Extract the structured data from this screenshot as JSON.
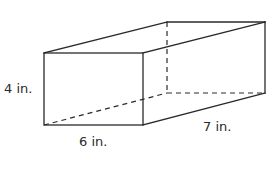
{
  "figure": {
    "type": "rectangular-prism",
    "dimensions": {
      "height": {
        "value": 4,
        "unit": "in.",
        "label": "4 in."
      },
      "width": {
        "value": 6,
        "unit": "in.",
        "label": "6 in."
      },
      "depth": {
        "value": 7,
        "unit": "in.",
        "label": "7 in."
      }
    },
    "stroke_color": "#2a2a2a",
    "vertices": {
      "front_top_left": [
        44,
        53
      ],
      "front_top_right": [
        143,
        53
      ],
      "front_bottom_left": [
        44,
        125
      ],
      "front_bottom_right": [
        143,
        125
      ],
      "back_top_left": [
        167,
        22
      ],
      "back_top_right": [
        265,
        22
      ],
      "back_bottom_left": [
        167,
        93
      ],
      "back_bottom_right": [
        265,
        93
      ]
    }
  }
}
